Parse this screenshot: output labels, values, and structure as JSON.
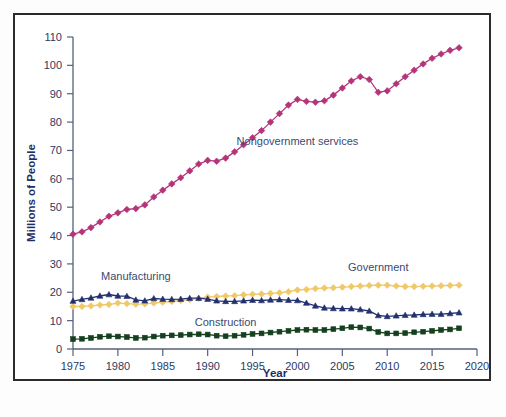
{
  "chart_data": {
    "type": "line",
    "title": "",
    "xlabel": "Year",
    "ylabel": "Millions of People",
    "xlim": [
      1975,
      2020
    ],
    "ylim": [
      0,
      110
    ],
    "xticks": [
      1975,
      1980,
      1985,
      1990,
      1995,
      2000,
      2005,
      2010,
      2015,
      2020
    ],
    "yticks": [
      0,
      10,
      20,
      30,
      40,
      50,
      60,
      70,
      80,
      90,
      100,
      110
    ],
    "grid": false,
    "legend": "inline-annotations",
    "x": [
      1975,
      1976,
      1977,
      1978,
      1979,
      1980,
      1981,
      1982,
      1983,
      1984,
      1985,
      1986,
      1987,
      1988,
      1989,
      1990,
      1991,
      1992,
      1993,
      1994,
      1995,
      1996,
      1997,
      1998,
      1999,
      2000,
      2001,
      2002,
      2003,
      2004,
      2005,
      2006,
      2007,
      2008,
      2009,
      2010,
      2011,
      2012,
      2013,
      2014,
      2015,
      2016,
      2017,
      2018
    ],
    "series": [
      {
        "name": "Nongovernment services",
        "color": "#b4347a",
        "marker": "diamond",
        "label_x": 2000,
        "label_y": 72,
        "values": [
          40.5,
          41.3,
          42.8,
          44.8,
          46.8,
          48.0,
          49.2,
          49.5,
          50.8,
          53.6,
          56.0,
          58.2,
          60.4,
          62.8,
          65.2,
          66.5,
          66.2,
          67.3,
          69.5,
          72.0,
          74.5,
          77.0,
          80.0,
          83.0,
          86.0,
          88.0,
          87.3,
          87.0,
          87.5,
          89.5,
          92.0,
          94.5,
          96.0,
          95.0,
          90.5,
          91.0,
          93.5,
          96.0,
          98.3,
          100.5,
          102.5,
          104.0,
          105.3,
          106.2
        ]
      },
      {
        "name": "Government",
        "color": "#f0c868",
        "marker": "diamond",
        "label_x": 2009,
        "label_y": 27.5,
        "values": [
          15.0,
          15.0,
          15.2,
          15.5,
          15.7,
          16.2,
          16.0,
          15.8,
          15.9,
          16.2,
          16.5,
          16.8,
          17.1,
          17.4,
          17.8,
          18.3,
          18.5,
          18.7,
          18.8,
          19.1,
          19.3,
          19.4,
          19.6,
          19.8,
          20.2,
          20.8,
          21.0,
          21.3,
          21.5,
          21.6,
          21.8,
          22.0,
          22.2,
          22.4,
          22.5,
          22.5,
          22.2,
          22.0,
          22.0,
          22.1,
          22.2,
          22.3,
          22.4,
          22.5
        ]
      },
      {
        "name": "Manufacturing",
        "color": "#24306e",
        "marker": "triangle",
        "label_x": 1982,
        "label_y": 24.5,
        "values": [
          16.9,
          17.5,
          18.0,
          18.7,
          19.2,
          18.7,
          18.6,
          17.3,
          17.0,
          17.8,
          17.6,
          17.5,
          17.6,
          17.9,
          17.9,
          17.6,
          17.0,
          16.8,
          16.8,
          17.0,
          17.2,
          17.1,
          17.3,
          17.4,
          17.2,
          17.1,
          16.2,
          15.2,
          14.5,
          14.3,
          14.2,
          14.2,
          13.9,
          13.4,
          11.8,
          11.5,
          11.7,
          11.9,
          12.0,
          12.2,
          12.3,
          12.3,
          12.5,
          12.8
        ]
      },
      {
        "name": "Construction",
        "color": "#14401e",
        "marker": "square",
        "label_x": 1992,
        "label_y": 8.2,
        "values": [
          3.5,
          3.6,
          3.9,
          4.3,
          4.5,
          4.4,
          4.2,
          3.9,
          4.0,
          4.4,
          4.7,
          4.8,
          4.9,
          5.1,
          5.2,
          5.1,
          4.7,
          4.5,
          4.7,
          5.0,
          5.3,
          5.5,
          5.8,
          6.1,
          6.4,
          6.7,
          6.8,
          6.7,
          6.7,
          7.0,
          7.3,
          7.7,
          7.6,
          7.2,
          6.0,
          5.5,
          5.5,
          5.6,
          5.9,
          6.1,
          6.4,
          6.7,
          6.9,
          7.3
        ]
      }
    ]
  }
}
